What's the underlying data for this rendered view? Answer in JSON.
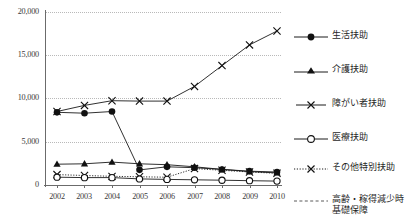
{
  "chart_data": {
    "type": "line",
    "title": "",
    "subtitle": "",
    "xlabel": "",
    "ylabel": "",
    "categories": [
      "2002",
      "2003",
      "2004",
      "2005",
      "2006",
      "2007",
      "2008",
      "2009",
      "2010"
    ],
    "ylim": [
      0,
      20000
    ],
    "yticks": [
      0,
      5000,
      10000,
      15000,
      20000
    ],
    "ytick_labels": [
      "0",
      "5,000",
      "10,000",
      "15,000",
      "20,000"
    ],
    "grid": true,
    "legend_position": "right",
    "series": [
      {
        "name": "生活扶助",
        "marker": "filled-circle",
        "line": "solid",
        "values": [
          8400,
          8300,
          8500,
          1750,
          2100,
          2000,
          1800,
          1600,
          1500
        ]
      },
      {
        "name": "介護扶助",
        "marker": "filled-triangle",
        "line": "solid",
        "values": [
          2400,
          2450,
          2650,
          2450,
          2350,
          2100,
          1800,
          1550,
          1400
        ]
      },
      {
        "name": "障がい者扶助",
        "marker": "cross-x",
        "line": "solid",
        "values": [
          8500,
          9200,
          9750,
          9700,
          9700,
          11400,
          13800,
          16200,
          17800
        ]
      },
      {
        "name": "医療扶助",
        "marker": "open-circle",
        "line": "solid",
        "values": [
          900,
          850,
          850,
          700,
          650,
          600,
          550,
          500,
          450
        ]
      },
      {
        "name": "その他特別扶助",
        "marker": "cross-x",
        "line": "dotted",
        "values": [
          1200,
          1100,
          1000,
          950,
          900,
          1900,
          1700,
          1500,
          1350
        ]
      },
      {
        "name": "高齢・稼得減少時基礎保障",
        "name_line1": "高齢・稼得減少時",
        "name_line2": "基礎保障",
        "marker": "none",
        "line": "dashed",
        "values": [
          null,
          null,
          null,
          null,
          null,
          null,
          null,
          null,
          null
        ]
      }
    ]
  },
  "legend": {
    "items": [
      {
        "label": "生活扶助",
        "symbol": "filled-circle-line"
      },
      {
        "label": "介護扶助",
        "symbol": "filled-triangle-line"
      },
      {
        "label": "障がい者扶助",
        "symbol": "cross-x-line"
      },
      {
        "label": "医療扶助",
        "symbol": "open-circle-line"
      },
      {
        "label": "その他特別扶助",
        "symbol": "dotted-cross-x-line"
      },
      {
        "label": "高齢・稼得減少時",
        "label2": "基礎保障",
        "symbol": "dashed-line"
      }
    ]
  }
}
